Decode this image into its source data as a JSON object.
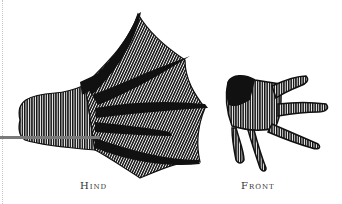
{
  "figure": {
    "panels": [
      {
        "id": "hind",
        "label": "Hind",
        "description": "webbed hind foot, five toes with hatched webbing"
      },
      {
        "id": "front",
        "label": "Front",
        "description": "front hand with four fingers, hatched shading"
      }
    ],
    "colors": {
      "ink": "#111111",
      "pointer_line": "#7a7a7a",
      "background": "#ffffff"
    }
  }
}
